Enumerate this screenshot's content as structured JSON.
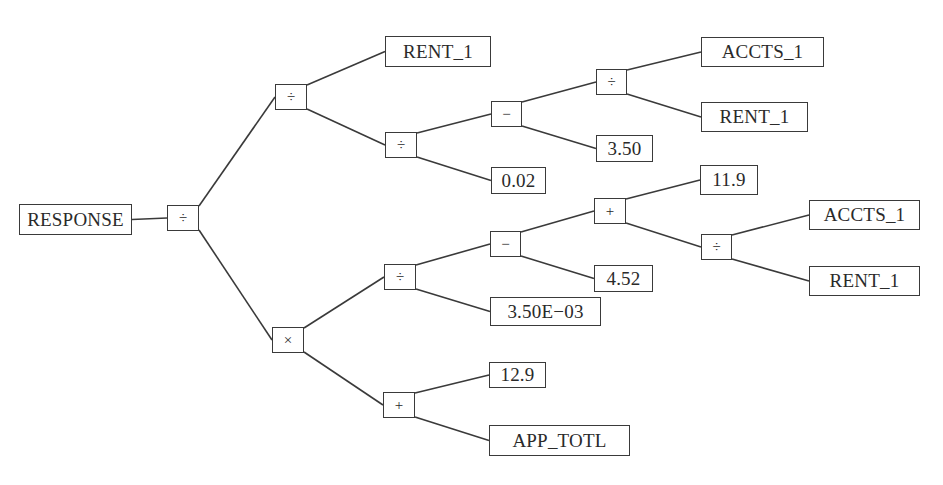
{
  "diagram": {
    "type": "expression-tree",
    "root_label": "RESPONSE",
    "nodes": [
      {
        "id": "response",
        "kind": "leaf",
        "label": "RESPONSE",
        "x": 19,
        "y": 204,
        "w": 113,
        "h": 31
      },
      {
        "id": "root_div",
        "kind": "op",
        "label": "÷",
        "x": 167,
        "y": 205,
        "w": 32,
        "h": 26
      },
      {
        "id": "a_div",
        "kind": "op",
        "label": "÷",
        "x": 275,
        "y": 84,
        "w": 32,
        "h": 26
      },
      {
        "id": "rent1_top",
        "kind": "leaf",
        "label": "RENT_1",
        "x": 385,
        "y": 36,
        "w": 106,
        "h": 31
      },
      {
        "id": "b_div",
        "kind": "op",
        "label": "÷",
        "x": 385,
        "y": 132,
        "w": 32,
        "h": 26
      },
      {
        "id": "c_minus",
        "kind": "op",
        "label": "−",
        "x": 491,
        "y": 101,
        "w": 31,
        "h": 26
      },
      {
        "id": "val_002",
        "kind": "leaf",
        "label": "0.02",
        "x": 491,
        "y": 167,
        "w": 55,
        "h": 27
      },
      {
        "id": "d_div",
        "kind": "op",
        "label": "÷",
        "x": 596,
        "y": 69,
        "w": 31,
        "h": 26
      },
      {
        "id": "val_350",
        "kind": "leaf",
        "label": "3.50",
        "x": 596,
        "y": 135,
        "w": 57,
        "h": 27
      },
      {
        "id": "accts1_top",
        "kind": "leaf",
        "label": "ACCTS_1",
        "x": 701,
        "y": 37,
        "w": 123,
        "h": 30
      },
      {
        "id": "rent1_mid",
        "kind": "leaf",
        "label": "RENT_1",
        "x": 701,
        "y": 102,
        "w": 107,
        "h": 30
      },
      {
        "id": "mul",
        "kind": "op",
        "label": "×",
        "x": 272,
        "y": 327,
        "w": 32,
        "h": 26
      },
      {
        "id": "e_div",
        "kind": "op",
        "label": "÷",
        "x": 384,
        "y": 264,
        "w": 32,
        "h": 26
      },
      {
        "id": "f_minus",
        "kind": "op",
        "label": "−",
        "x": 490,
        "y": 231,
        "w": 31,
        "h": 26
      },
      {
        "id": "val_350e03",
        "kind": "leaf",
        "label": "3.50E−03",
        "x": 490,
        "y": 297,
        "w": 111,
        "h": 29
      },
      {
        "id": "g_plus",
        "kind": "op",
        "label": "+",
        "x": 594,
        "y": 198,
        "w": 32,
        "h": 26
      },
      {
        "id": "val_452",
        "kind": "leaf",
        "label": "4.52",
        "x": 594,
        "y": 265,
        "w": 59,
        "h": 27
      },
      {
        "id": "val_119",
        "kind": "leaf",
        "label": "11.9",
        "x": 700,
        "y": 165,
        "w": 58,
        "h": 30
      },
      {
        "id": "h_div",
        "kind": "op",
        "label": "÷",
        "x": 701,
        "y": 234,
        "w": 31,
        "h": 26
      },
      {
        "id": "accts1_low",
        "kind": "leaf",
        "label": "ACCTS_1",
        "x": 809,
        "y": 200,
        "w": 111,
        "h": 30
      },
      {
        "id": "rent1_low",
        "kind": "leaf",
        "label": "RENT_1",
        "x": 809,
        "y": 266,
        "w": 111,
        "h": 30
      },
      {
        "id": "i_plus",
        "kind": "op",
        "label": "+",
        "x": 383,
        "y": 392,
        "w": 32,
        "h": 26
      },
      {
        "id": "val_129",
        "kind": "leaf",
        "label": "12.9",
        "x": 489,
        "y": 362,
        "w": 57,
        "h": 26
      },
      {
        "id": "app_totl",
        "kind": "leaf",
        "label": "APP_TOTL",
        "x": 489,
        "y": 425,
        "w": 141,
        "h": 31
      }
    ],
    "edges": [
      {
        "from": "response",
        "to": "root_div",
        "port": "mid"
      },
      {
        "from": "root_div",
        "to": "a_div",
        "port": "top"
      },
      {
        "from": "root_div",
        "to": "mul",
        "port": "bottom"
      },
      {
        "from": "a_div",
        "to": "rent1_top",
        "port": "top"
      },
      {
        "from": "a_div",
        "to": "b_div",
        "port": "bottom"
      },
      {
        "from": "b_div",
        "to": "c_minus",
        "port": "top"
      },
      {
        "from": "b_div",
        "to": "val_002",
        "port": "bottom"
      },
      {
        "from": "c_minus",
        "to": "d_div",
        "port": "top"
      },
      {
        "from": "c_minus",
        "to": "val_350",
        "port": "bottom"
      },
      {
        "from": "d_div",
        "to": "accts1_top",
        "port": "top"
      },
      {
        "from": "d_div",
        "to": "rent1_mid",
        "port": "bottom"
      },
      {
        "from": "mul",
        "to": "e_div",
        "port": "top"
      },
      {
        "from": "mul",
        "to": "i_plus",
        "port": "bottom"
      },
      {
        "from": "e_div",
        "to": "f_minus",
        "port": "top"
      },
      {
        "from": "e_div",
        "to": "val_350e03",
        "port": "bottom"
      },
      {
        "from": "f_minus",
        "to": "g_plus",
        "port": "top"
      },
      {
        "from": "f_minus",
        "to": "val_452",
        "port": "bottom"
      },
      {
        "from": "g_plus",
        "to": "val_119",
        "port": "top"
      },
      {
        "from": "g_plus",
        "to": "h_div",
        "port": "bottom"
      },
      {
        "from": "h_div",
        "to": "accts1_low",
        "port": "top"
      },
      {
        "from": "h_div",
        "to": "rent1_low",
        "port": "bottom"
      },
      {
        "from": "i_plus",
        "to": "val_129",
        "port": "top"
      },
      {
        "from": "i_plus",
        "to": "app_totl",
        "port": "bottom"
      }
    ]
  },
  "colors": {
    "line": "#3a3a3a",
    "text": "#2a2a2a",
    "background": "#ffffff"
  }
}
